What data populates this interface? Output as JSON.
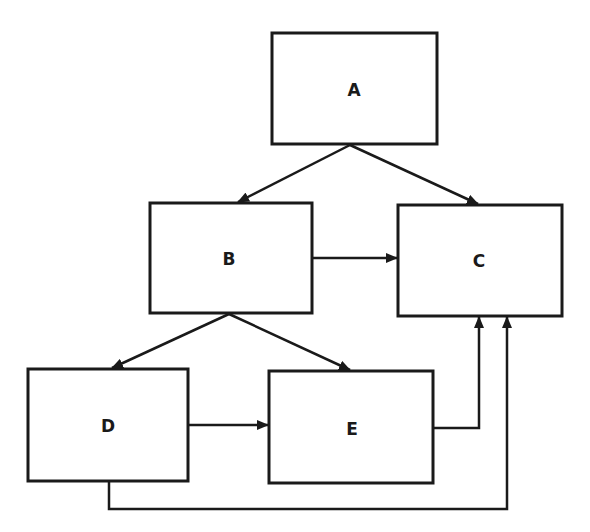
{
  "diagram": {
    "type": "flowchart",
    "colors": {
      "stroke": "#1a1a1a",
      "background": "#ffffff"
    },
    "nodes": [
      {
        "id": "A",
        "label": "A",
        "x": 272,
        "y": 33,
        "w": 165,
        "h": 111
      },
      {
        "id": "B",
        "label": "B",
        "x": 150,
        "y": 203,
        "w": 162,
        "h": 110
      },
      {
        "id": "C",
        "label": "C",
        "x": 398,
        "y": 205,
        "w": 164,
        "h": 111
      },
      {
        "id": "D",
        "label": "D",
        "x": 28,
        "y": 369,
        "w": 160,
        "h": 112
      },
      {
        "id": "E",
        "label": "E",
        "x": 269,
        "y": 371,
        "w": 164,
        "h": 112
      }
    ],
    "edges": [
      {
        "from": "A",
        "to": "B"
      },
      {
        "from": "A",
        "to": "C"
      },
      {
        "from": "B",
        "to": "C"
      },
      {
        "from": "B",
        "to": "D"
      },
      {
        "from": "B",
        "to": "E"
      },
      {
        "from": "D",
        "to": "E"
      },
      {
        "from": "E",
        "to": "C"
      },
      {
        "from": "D",
        "to": "C"
      }
    ]
  }
}
